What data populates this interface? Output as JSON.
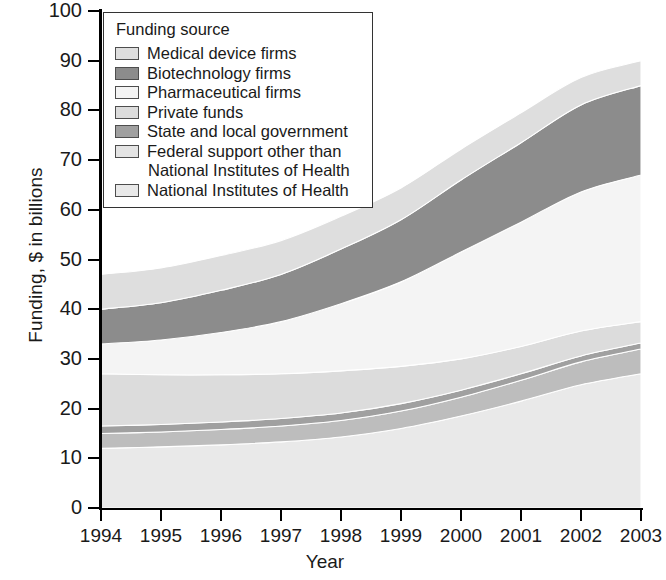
{
  "chart_data": {
    "type": "area",
    "stacked": true,
    "title": "",
    "xlabel": "Year",
    "ylabel": "Funding, $ in billions",
    "x": [
      1994,
      1995,
      1996,
      1997,
      1998,
      1999,
      2000,
      2001,
      2002,
      2003
    ],
    "categories": [
      "1994",
      "1995",
      "1996",
      "1997",
      "1998",
      "1999",
      "2000",
      "2001",
      "2002",
      "2003"
    ],
    "xlim": [
      1994,
      2003
    ],
    "ylim": [
      0,
      100
    ],
    "yticks": [
      0,
      10,
      20,
      30,
      40,
      50,
      60,
      70,
      80,
      90,
      100
    ],
    "grid": false,
    "legend_position": "upper-left",
    "legend_title": "Funding source",
    "stack_order_bottom_to_top": [
      "National Institutes of Health",
      "Federal support other than National Institutes of Health",
      "State and local government",
      "Private funds",
      "Pharmaceutical firms",
      "Biotechnology firms",
      "Medical device firms"
    ],
    "series": [
      {
        "name": "National Institutes of Health",
        "color": "#e9e9e9",
        "values": [
          12.0,
          12.3,
          12.7,
          13.3,
          14.3,
          16.0,
          18.5,
          21.5,
          24.8,
          27.0
        ]
      },
      {
        "name": "Federal support other than National Institutes of Health",
        "color": "#bdbdbd",
        "values": [
          3.0,
          3.0,
          3.1,
          3.2,
          3.3,
          3.5,
          3.8,
          4.2,
          4.6,
          5.0
        ]
      },
      {
        "name": "State and local government",
        "color": "#a0a0a0",
        "values": [
          1.5,
          1.5,
          1.5,
          1.5,
          1.5,
          1.5,
          1.4,
          1.3,
          1.2,
          1.2
        ]
      },
      {
        "name": "Private funds",
        "color": "#dcdcdc",
        "values": [
          10.5,
          10.0,
          9.5,
          9.0,
          8.5,
          7.5,
          6.3,
          5.5,
          5.0,
          4.3
        ]
      },
      {
        "name": "Pharmaceutical firms",
        "color": "#f4f4f4",
        "values": [
          6.0,
          7.0,
          8.5,
          10.5,
          13.5,
          17.0,
          21.5,
          25.0,
          28.0,
          29.5
        ]
      },
      {
        "name": "Biotechnology firms",
        "color": "#8c8c8c",
        "values": [
          7.0,
          7.5,
          8.5,
          9.5,
          11.0,
          12.5,
          14.5,
          16.0,
          17.5,
          18.0
        ]
      },
      {
        "name": "Medical device firms",
        "color": "#dedede",
        "values": [
          7.0,
          7.0,
          7.0,
          6.8,
          6.6,
          6.4,
          6.2,
          6.0,
          5.5,
          5.0
        ]
      }
    ],
    "cumulative_tops": {
      "National Institutes of Health": [
        12.0,
        12.3,
        12.7,
        13.3,
        14.3,
        16.0,
        18.5,
        21.5,
        24.8,
        27.0
      ],
      "Federal support other than National Institutes of Health": [
        15.0,
        15.3,
        15.8,
        16.5,
        17.6,
        19.5,
        22.3,
        25.7,
        29.4,
        32.0
      ],
      "State and local government": [
        16.5,
        16.8,
        17.3,
        18.0,
        19.1,
        21.0,
        23.7,
        27.0,
        30.6,
        33.2
      ],
      "Private funds": [
        27.0,
        26.8,
        26.8,
        27.0,
        27.6,
        28.5,
        30.0,
        32.5,
        35.6,
        37.5
      ],
      "Pharmaceutical firms": [
        33.0,
        33.8,
        35.3,
        37.5,
        41.1,
        45.5,
        51.5,
        57.5,
        63.6,
        67.0
      ],
      "Biotechnology firms": [
        40.0,
        41.3,
        43.8,
        47.0,
        52.1,
        58.0,
        66.0,
        73.5,
        81.1,
        85.0
      ],
      "Medical device firms": [
        47.0,
        48.3,
        50.8,
        53.8,
        58.7,
        64.4,
        72.2,
        79.5,
        86.6,
        90.0
      ]
    }
  },
  "axes": {
    "y_title": "Funding, $ in billions",
    "x_title": "Year",
    "y_tick_labels": [
      "100",
      "90",
      "80",
      "70",
      "60",
      "50",
      "40",
      "30",
      "20",
      "10",
      "0"
    ],
    "x_tick_labels": [
      "1994",
      "1995",
      "1996",
      "1997",
      "1998",
      "1999",
      "2000",
      "2001",
      "2002",
      "2003"
    ]
  },
  "legend": {
    "title": "Funding source",
    "items": [
      {
        "label": "Medical device firms",
        "color": "#dedede"
      },
      {
        "label": "Biotechnology firms",
        "color": "#8c8c8c"
      },
      {
        "label": "Pharmaceutical firms",
        "color": "#f4f4f4"
      },
      {
        "label": "Private funds",
        "color": "#dcdcdc"
      },
      {
        "label": "State and local government",
        "color": "#a0a0a0"
      },
      {
        "label": "Federal support other than",
        "color": "#e4e4e4",
        "continuation": "National Institutes of Health"
      },
      {
        "label": "National Institutes of Health",
        "color": "#e9e9e9"
      }
    ]
  }
}
